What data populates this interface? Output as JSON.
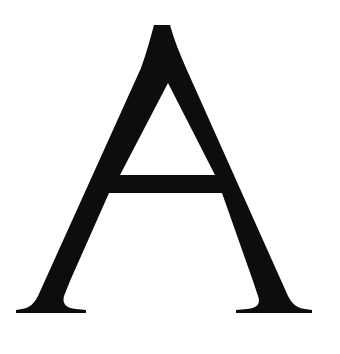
{
  "canvas": {
    "width": 340,
    "height": 354,
    "background_color": "#FFFFFF"
  },
  "glyph": {
    "character": "A",
    "name": "latin-capital-letter-a",
    "style": "serif",
    "fill_color": "#0D0D0D",
    "description": "Serif capital letter A",
    "metrics": {
      "apex_tip_y": 25,
      "apex_tip_x_left": 160,
      "apex_tip_x_right": 168,
      "baseline_y": 313,
      "crossbar_top_y": 168,
      "crossbar_bottom_y": 184,
      "counter_apex_y": 83,
      "left_foot_x_start": 16,
      "left_foot_x_end": 86,
      "right_foot_x_start": 233,
      "right_foot_x_end": 312,
      "cap_height": 288
    },
    "path": "M 163.5 25 L 154 25 C 150 40 146 54 141 68 L 38 296 C 34 304 29 308 22 309 L 16 310 L 16 313 L 86 313 L 86 310 L 76 309 C 66 308 62 304 64 296 L 70 281 L 109 193 L 222 193 L 253 281 L 258 296 C 261 304 257 308 247 309 L 236 310 L 236 313 L 312 313 L 312 310 L 305 309 C 297 308 292 304 288 296 L 186 68 C 180 54 174 40 170 25 Z M 168 83 L 215 175 L 120 175 Z"
  }
}
